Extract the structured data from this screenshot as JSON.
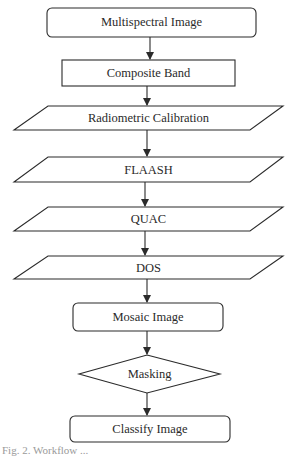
{
  "diagram": {
    "type": "flowchart",
    "nodes": [
      {
        "id": "n1",
        "label": "Multispectral Image",
        "shape": "rounded-rect"
      },
      {
        "id": "n2",
        "label": "Composite Band",
        "shape": "rect"
      },
      {
        "id": "n3",
        "label": "Radiometric Calibration",
        "shape": "parallelogram"
      },
      {
        "id": "n4",
        "label": "FLAASH",
        "shape": "parallelogram"
      },
      {
        "id": "n5",
        "label": "QUAC",
        "shape": "parallelogram"
      },
      {
        "id": "n6",
        "label": "DOS",
        "shape": "parallelogram"
      },
      {
        "id": "n7",
        "label": "Mosaic Image",
        "shape": "rounded-rect"
      },
      {
        "id": "n8",
        "label": "Masking",
        "shape": "diamond"
      },
      {
        "id": "n9",
        "label": "Classify Image",
        "shape": "rounded-rect"
      }
    ],
    "edges": [
      {
        "from": "n1",
        "to": "n2"
      },
      {
        "from": "n2",
        "to": "n3"
      },
      {
        "from": "n3",
        "to": "n4"
      },
      {
        "from": "n4",
        "to": "n5"
      },
      {
        "from": "n5",
        "to": "n6"
      },
      {
        "from": "n6",
        "to": "n7"
      },
      {
        "from": "n7",
        "to": "n8"
      },
      {
        "from": "n8",
        "to": "n9"
      }
    ],
    "caption": "Fig. 2. Workflow ..."
  }
}
